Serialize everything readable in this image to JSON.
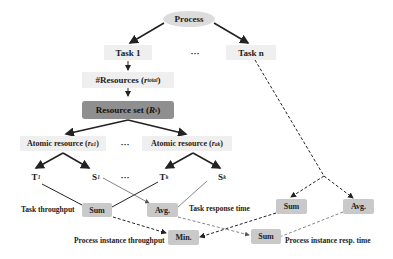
{
  "diagram": {
    "process": "Process",
    "task_1": "Task 1",
    "task_ellipsis": "···",
    "task_n": "Task n",
    "resources_prefix": "#Resources (",
    "resources_var": "r",
    "resources_sub": "total",
    "resources_suffix": ")",
    "resource_set_prefix": "Resource set (",
    "resource_set_var": "R",
    "resource_set_sub": "s",
    "resource_set_suffix": ")",
    "atomic_1_prefix": "Atomic resource (",
    "atomic_1_var": "r",
    "atomic_1_sub": "a1",
    "atomic_1_suffix": ")",
    "atomic_ellipsis": "···",
    "atomic_k_prefix": "Atomic resource (",
    "atomic_k_var": "r",
    "atomic_k_sub": "ak",
    "atomic_k_suffix": ")",
    "t1": "T",
    "t1_sub": "1",
    "s1": "S",
    "s1_sub": "1",
    "ts_ellipsis": "···",
    "tk": "T",
    "tk_sub": "k",
    "sk": "S",
    "sk_sub": "k",
    "sum_left": "Sum",
    "avg_left": "Avg.",
    "sum_right": "Sum",
    "avg_right": "Avg.",
    "min": "Min.",
    "sum_bottom": "Sum",
    "label_task_throughput": "Task throughput",
    "label_task_response_time": "Task response time",
    "label_process_instance_throughput": "Process instance throughput",
    "label_process_instance_resp_time": "Process instance resp. time"
  }
}
